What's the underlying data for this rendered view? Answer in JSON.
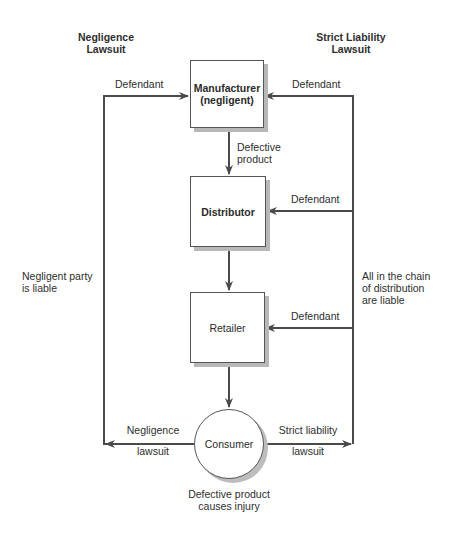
{
  "headers": {
    "left": [
      "Negligence",
      "Lawsuit"
    ],
    "right": [
      "Strict Liability",
      "Lawsuit"
    ]
  },
  "nodes": {
    "manufacturer": [
      "Manufacturer",
      "(negligent)"
    ],
    "distributor": "Distributor",
    "retailer": "Retailer",
    "consumer": "Consumer"
  },
  "edge_labels": {
    "defective_product": [
      "Defective",
      "product"
    ],
    "left_defendant": "Defendant",
    "right_defendant_manufacturer": "Defendant",
    "right_defendant_distributor": "Defendant",
    "right_defendant_retailer": "Defendant",
    "negligence_lawsuit": [
      "Negligence",
      "lawsuit"
    ],
    "strict_liability_lawsuit": [
      "Strict liability",
      "lawsuit"
    ]
  },
  "side_notes": {
    "left": [
      "Negligent party",
      "is liable"
    ],
    "right": [
      "All in the chain",
      "of distribution",
      "are liable"
    ]
  },
  "caption": [
    "Defective product",
    "causes injury"
  ],
  "colors": {
    "line": "#4a4a4a",
    "shadow": "#b8b8b8",
    "border": "#555555"
  }
}
